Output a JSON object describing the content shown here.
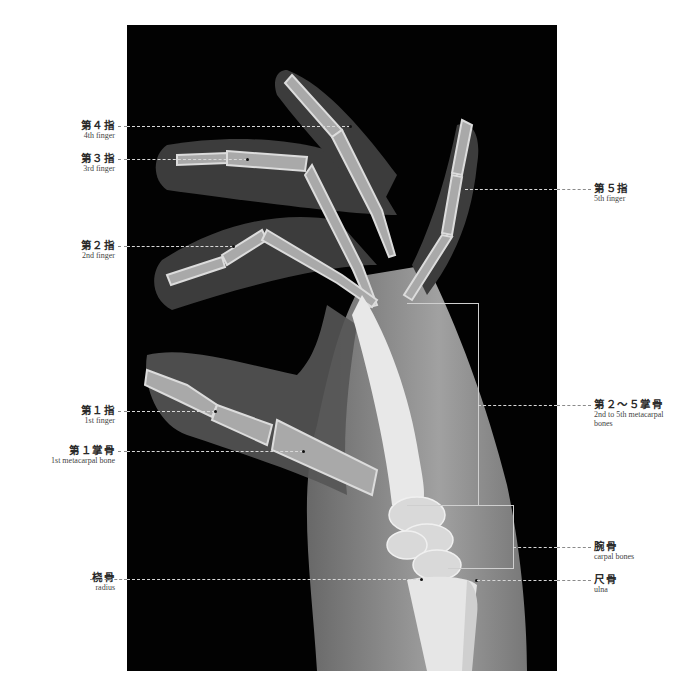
{
  "figure": {
    "background": "#ffffff",
    "xray_background": "#020202"
  },
  "labels": {
    "left": [
      {
        "id": "finger-4",
        "jp": "第４指",
        "en": "4th finger",
        "y": 126
      },
      {
        "id": "finger-3",
        "jp": "第３指",
        "en": "3rd finger",
        "y": 159
      },
      {
        "id": "finger-2",
        "jp": "第２指",
        "en": "2nd finger",
        "y": 246
      },
      {
        "id": "finger-1",
        "jp": "第１指",
        "en": "1st finger",
        "y": 411
      },
      {
        "id": "metacarpal-1",
        "jp": "第１掌骨",
        "en": "1st metacarpal bone",
        "y": 451
      },
      {
        "id": "radius",
        "jp": "桡骨",
        "en": "radius",
        "y": 579
      }
    ],
    "right": [
      {
        "id": "finger-5",
        "jp": "第５指",
        "en": "5th finger",
        "y": 189
      },
      {
        "id": "metacarpal-2-5",
        "jp": "第２～５掌骨",
        "en": "2nd to 5th metacarpal",
        "en2": "bones",
        "y": 405
      },
      {
        "id": "carpal",
        "jp": "腕骨",
        "en": "carpal bones",
        "y": 547
      },
      {
        "id": "ulna",
        "jp": "尺骨",
        "en": "ulna",
        "y": 580
      }
    ]
  }
}
